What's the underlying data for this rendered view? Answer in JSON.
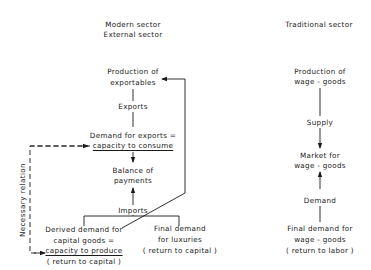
{
  "modern": {
    "header_line1": "Modern sector",
    "header_line2": "External sector",
    "production": [
      "Production of",
      "exportables"
    ],
    "exports": "Exports",
    "demand_exports": [
      "Demand for exports =",
      "capacity to consume"
    ],
    "balance": [
      "Balance of",
      "payments"
    ],
    "imports": "Imports",
    "derived": [
      "Derived demand for",
      "capital goods =",
      "capacity to produce",
      "( return to capital )"
    ],
    "luxuries": [
      "Final demand",
      "for luxuries",
      "( return to capital )"
    ],
    "necessary_relation": "Necessary relation"
  },
  "traditional": {
    "header": "Traditional sector",
    "production": [
      "Production of",
      "wage - goods"
    ],
    "supply": "Supply",
    "market": [
      "Market for",
      "wage - goods"
    ],
    "demand": "Demand",
    "final_demand": [
      "Final demand for",
      "wage - goods",
      "( return to labor )"
    ]
  },
  "colors": {
    "ink": "#1a1a1a",
    "background": "#ffffff"
  }
}
